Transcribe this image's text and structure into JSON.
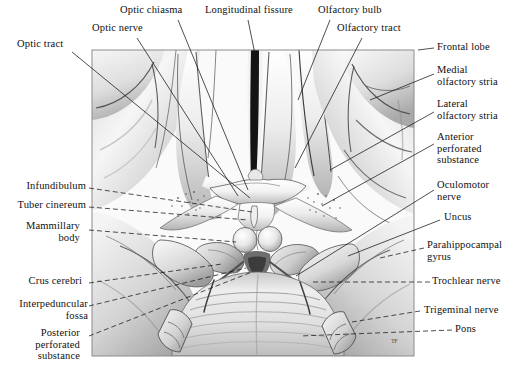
{
  "figure": {
    "artist_monogram": "TF",
    "frame": {
      "x": 92,
      "y": 50,
      "width": 322,
      "height": 306
    },
    "background_color": "#ffffff",
    "ink_color": "#101010"
  },
  "labels": [
    {
      "id": "optic-tract",
      "text": "Optic tract",
      "align": "left",
      "x": 17,
      "y": 44,
      "lines": [
        "Optic tract"
      ]
    },
    {
      "id": "optic-nerve",
      "text": "Optic nerve",
      "align": "left",
      "x": 92,
      "y": 28,
      "lines": [
        "Optic nerve"
      ]
    },
    {
      "id": "optic-chiasma",
      "text": "Optic chiasma",
      "align": "left",
      "x": 120,
      "y": 8,
      "lines": [
        "Optic chiasma"
      ]
    },
    {
      "id": "longitudinal-fissure",
      "text": "Longitudinal fissure",
      "align": "left",
      "x": 205,
      "y": 8,
      "lines": [
        "Longitudinal fissure"
      ]
    },
    {
      "id": "olfactory-bulb",
      "text": "Olfactory bulb",
      "align": "left",
      "x": 318,
      "y": 8,
      "lines": [
        "Olfactory bulb"
      ]
    },
    {
      "id": "olfactory-tract",
      "text": "Olfactory tract",
      "align": "left",
      "x": 337,
      "y": 26,
      "lines": [
        "Olfactory tract"
      ]
    },
    {
      "id": "frontal-lobe",
      "text": "Frontal lobe",
      "align": "left",
      "x": 437,
      "y": 45,
      "lines": [
        "Frontal lobe"
      ]
    },
    {
      "id": "medial-olfactory-stria",
      "text": "Medial olfactory stria",
      "align": "left",
      "x": 437,
      "y": 68,
      "lines": [
        "Medial",
        "olfactory stria"
      ]
    },
    {
      "id": "lateral-olfactory-stria",
      "text": "Lateral olfactory stria",
      "align": "left",
      "x": 437,
      "y": 102,
      "lines": [
        "Lateral",
        "olfactory stria"
      ]
    },
    {
      "id": "anterior-perforated-substance",
      "text": "Anterior perforated substance",
      "align": "left",
      "x": 437,
      "y": 134,
      "lines": [
        "Anterior",
        "perforated",
        "substance"
      ]
    },
    {
      "id": "oculomotor-nerve",
      "text": "Oculomotor nerve",
      "align": "left",
      "x": 437,
      "y": 182,
      "lines": [
        "Oculomotor",
        "nerve"
      ]
    },
    {
      "id": "uncus",
      "text": "Uncus",
      "align": "left",
      "x": 444,
      "y": 214,
      "lines": [
        "Uncus"
      ]
    },
    {
      "id": "parahippocampal-gyrus",
      "text": "Parahippocampal gyrus",
      "align": "left",
      "x": 427,
      "y": 241,
      "lines": [
        "Parahippocampal",
        "gyrus"
      ]
    },
    {
      "id": "trochlear-nerve",
      "text": "Trochlear nerve",
      "align": "left",
      "x": 432,
      "y": 278,
      "lines": [
        "Trochlear nerve"
      ]
    },
    {
      "id": "trigeminal-nerve",
      "text": "Trigeminal nerve",
      "align": "left",
      "x": 424,
      "y": 307,
      "lines": [
        "Trigeminal nerve"
      ]
    },
    {
      "id": "pons",
      "text": "Pons",
      "align": "left",
      "x": 455,
      "y": 326,
      "lines": [
        "Pons"
      ]
    },
    {
      "id": "infundibulum",
      "text": "Infundibulum",
      "align": "right",
      "x": 86,
      "y": 183,
      "lines": [
        "Infundibulum"
      ]
    },
    {
      "id": "tuber-cinereum",
      "text": "Tuber cinereum",
      "align": "right",
      "x": 86,
      "y": 202,
      "lines": [
        "Tuber cinereum"
      ]
    },
    {
      "id": "mammillary-body",
      "text": "Mammillary body",
      "align": "right",
      "x": 73,
      "y": 223,
      "lines": [
        "Mammillary",
        "body"
      ]
    },
    {
      "id": "crus-cerebri",
      "text": "Crus cerebri",
      "align": "right",
      "x": 71,
      "y": 278,
      "lines": [
        "Crus cerebri"
      ]
    },
    {
      "id": "interpeduncular-fossa",
      "text": "Interpeduncular fossa",
      "align": "right",
      "x": 85,
      "y": 301,
      "lines": [
        "Interpeduncular",
        "fossa"
      ]
    },
    {
      "id": "posterior-perforated-substance",
      "text": "Posterior perforated substance",
      "align": "right",
      "x": 74,
      "y": 330,
      "lines": [
        "Posterior",
        "perforated",
        "substance"
      ]
    }
  ],
  "structures": [
    "Optic tract",
    "Optic nerve",
    "Optic chiasma",
    "Longitudinal fissure",
    "Olfactory bulb",
    "Olfactory tract",
    "Frontal lobe",
    "Medial olfactory stria",
    "Lateral olfactory stria",
    "Anterior perforated substance",
    "Oculomotor nerve",
    "Uncus",
    "Parahippocampal gyrus",
    "Trochlear nerve",
    "Trigeminal nerve",
    "Pons",
    "Infundibulum",
    "Tuber cinereum",
    "Mammillary body",
    "Crus cerebri",
    "Interpeduncular fossa",
    "Posterior perforated substance"
  ]
}
